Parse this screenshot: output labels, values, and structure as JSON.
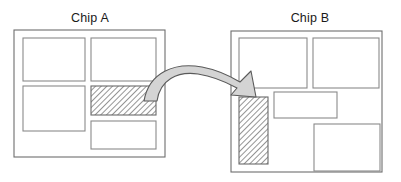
{
  "figure": {
    "kind": "block-diagram",
    "background_color": "#ffffff",
    "line_color": "#8a8a8a",
    "highlight_fill": "#ffffff",
    "hatch_color": "#7a7a7a",
    "arrow_fill": "#d4d4d4",
    "arrow_stroke": "#5a5a5a"
  },
  "chips": [
    {
      "id": "chip-a",
      "title": "Chip A",
      "title_x": 90,
      "title_y": 22,
      "outline": {
        "x": 14,
        "y": 30,
        "w": 151,
        "h": 127
      },
      "blocks": [
        {
          "id": "a-block-top-left",
          "x": 23,
          "y": 38,
          "w": 62,
          "h": 43,
          "hatched": false
        },
        {
          "id": "a-block-top-right",
          "x": 91,
          "y": 38,
          "w": 65,
          "h": 43,
          "hatched": false
        },
        {
          "id": "a-block-mid-left",
          "x": 23,
          "y": 86,
          "w": 62,
          "h": 45,
          "hatched": false
        },
        {
          "id": "a-block-mid-right",
          "x": 91,
          "y": 86,
          "w": 65,
          "h": 29,
          "hatched": true
        },
        {
          "id": "a-block-bottom-right",
          "x": 91,
          "y": 121,
          "w": 65,
          "h": 28,
          "hatched": false
        }
      ]
    },
    {
      "id": "chip-b",
      "title": "Chip B",
      "title_x": 310,
      "title_y": 22,
      "outline": {
        "x": 231,
        "y": 31,
        "w": 151,
        "h": 141
      },
      "blocks": [
        {
          "id": "b-block-top-left",
          "x": 239,
          "y": 38,
          "w": 68,
          "h": 50,
          "hatched": false
        },
        {
          "id": "b-block-top-right",
          "x": 313,
          "y": 38,
          "w": 66,
          "h": 50,
          "hatched": false
        },
        {
          "id": "b-block-mid-left",
          "x": 239,
          "y": 97,
          "w": 29,
          "h": 67,
          "hatched": true
        },
        {
          "id": "b-block-mid-right",
          "x": 274,
          "y": 92,
          "w": 63,
          "h": 26,
          "hatched": false
        },
        {
          "id": "b-block-bottom-right",
          "x": 314,
          "y": 124,
          "w": 66,
          "h": 47,
          "hatched": false
        }
      ]
    }
  ],
  "arrow": {
    "id": "transfer-arrow",
    "from_block": "a-block-mid-right",
    "to_block": "b-block-mid-left",
    "direction": "left-to-right",
    "style": "curved-ribbon",
    "path": "M 144 101 C 149 72, 175 62, 202 67 C 218 70, 230 76, 240 82 L 251 71 L 256 97 L 231 95 L 237 88 C 226 82, 211 76, 198 74 C 177 71, 160 80, 157 101 Z"
  }
}
